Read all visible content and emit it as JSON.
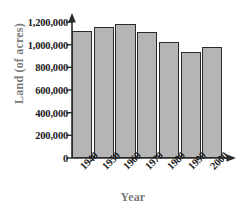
{
  "chart_data": {
    "type": "bar",
    "title": "",
    "xlabel": "Year",
    "ylabel": "Land (of acres)",
    "categories": [
      "1940",
      "1950",
      "1960",
      "1970",
      "1980",
      "1990",
      "2000"
    ],
    "values": [
      1120000,
      1160000,
      1185000,
      1115000,
      1025000,
      935000,
      980000
    ],
    "ylim": [
      0,
      1200000
    ],
    "yticks": [
      0,
      200000,
      400000,
      600000,
      800000,
      1000000,
      1200000
    ],
    "ytick_labels": [
      "0",
      "200,000",
      "400,000",
      "600,000",
      "800,000",
      "1,000,000",
      "1,200,000"
    ],
    "grid": false,
    "legend": null,
    "bar_fill_color": "#b5b5b5",
    "bar_border_color": "#2b2b2b",
    "axis_color": "#2b2b2b",
    "axis_title_color": "#7a7a7a",
    "tick_label_color": "#1a1a1a"
  }
}
